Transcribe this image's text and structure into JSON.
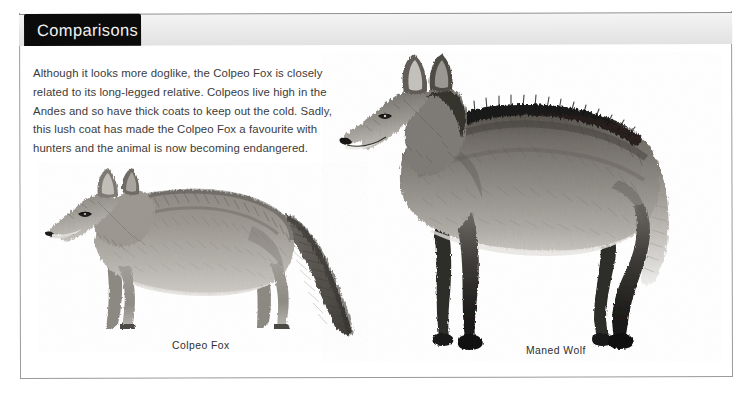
{
  "page": {
    "background_color": "#ffffff",
    "sheet_color": "#ffffff",
    "sheet_border_color": "#9a9a9a",
    "header_band_color": "#eaeaea"
  },
  "header": {
    "tab_label": "Comparisons",
    "tab_background": "#0b0b0b",
    "tab_text_color": "#f2f2f2"
  },
  "main": {
    "intro_paragraph": "Although it looks more doglike, the Colpeo Fox is closely related to its long-legged relative. Colpeos live high in the Andes and so have thick coats to keep out the cold. Sadly, this lush coat has made the Colpeo Fox a favourite with hunters and the animal is now becoming endangered.",
    "text_color": "#3b3b3b"
  },
  "figures": [
    {
      "id": "colpeo-fox",
      "caption": "Colpeo Fox",
      "description": "Pencil illustration of a Colpeo Fox standing in profile facing left, short legs, thick bushy tail",
      "style": "graphite-pencil-drawing"
    },
    {
      "id": "maned-wolf",
      "caption": "Maned Wolf",
      "description": "Pencil illustration of a Maned Wolf standing in profile facing left, very long dark legs, dark mane along neck and back, pale tail tip",
      "style": "graphite-pencil-drawing"
    }
  ]
}
